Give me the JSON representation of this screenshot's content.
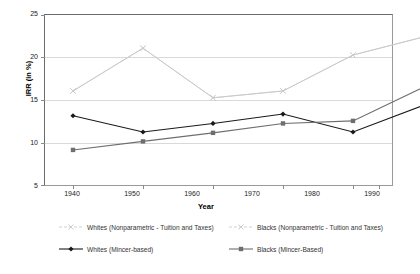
{
  "chart_data": {
    "type": "line",
    "title": "",
    "xlabel": "Year",
    "ylabel": "IRR (in %)",
    "categories": [
      1940,
      1950,
      1960,
      1970,
      1980,
      1990
    ],
    "x_tick_labels": [
      "1940",
      "1950",
      "1960",
      "1970",
      "1980",
      "1990"
    ],
    "y_tick_labels": [
      "5",
      "10",
      "15",
      "20",
      "25"
    ],
    "y_ticks": [
      5,
      10,
      15,
      20,
      25
    ],
    "ylim": [
      5,
      25
    ],
    "xlim": [
      1935,
      1995
    ],
    "grid": "horizontal",
    "legend_position": "bottom",
    "series": [
      {
        "name": "Whites (Nonparametric - Tuition and Taxes)",
        "marker": "x",
        "color": "#c9c9c9",
        "values": [
          16.0,
          21.0,
          15.2,
          16.0,
          20.2,
          22.3
        ]
      },
      {
        "name": "Blacks (Nonparametric - Tuition and Taxes)",
        "marker": "x",
        "color": "#c9c9c9",
        "values": [
          16.0,
          21.0,
          15.2,
          16.0,
          20.2,
          22.3
        ]
      },
      {
        "name": "Whites (Mincer-based)",
        "marker": "diamond",
        "color": "#1a1a1a",
        "values": [
          13.1,
          11.2,
          12.2,
          13.3,
          11.2,
          14.3
        ]
      },
      {
        "name": "Blacks (Mincer-Based)",
        "marker": "square",
        "color": "#6e6e6e",
        "values": [
          9.1,
          10.1,
          11.1,
          12.2,
          12.5,
          16.4
        ]
      }
    ]
  },
  "legend": {
    "entries": [
      {
        "label": "Whites (Nonparametric - Tuition and Taxes)",
        "marker": "x",
        "color": "#c9c9c9"
      },
      {
        "label": "Blacks (Nonparametric - Tuition and Taxes)",
        "marker": "x",
        "color": "#c9c9c9"
      },
      {
        "label": "Whites (Mincer-based)",
        "marker": "diamond",
        "color": "#1a1a1a"
      },
      {
        "label": "Blacks (Mincer-Based)",
        "marker": "square",
        "color": "#6e6e6e"
      }
    ]
  },
  "colors": {
    "nonparametric": "#c9c9c9",
    "whites_mincer": "#1a1a1a",
    "blacks_mincer": "#6e6e6e",
    "gridline": "#d9d9d9",
    "frame": "#8a8a8a"
  }
}
